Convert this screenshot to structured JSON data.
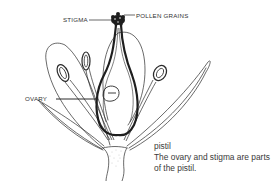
{
  "diagram": {
    "labels": {
      "stigma": "STIGMA",
      "pollen_grains": "POLLEN GRAINS",
      "ovary": "OVARY"
    },
    "caption": {
      "title": "pistil",
      "body": "The ovary and stigma are parts of the pistil."
    },
    "colors": {
      "line": "#2a2a2a",
      "background": "#ffffff",
      "text": "#333333"
    }
  }
}
